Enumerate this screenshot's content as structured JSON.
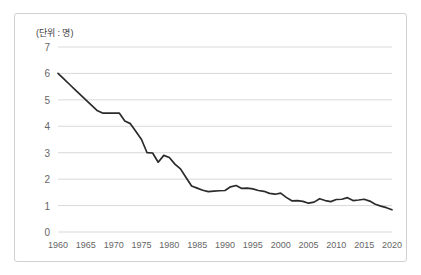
{
  "chart_data": {
    "type": "line",
    "title": "",
    "subtitle": "",
    "unit_label": "(단위 : 명)",
    "xlabel": "",
    "ylabel": "",
    "ylim": [
      0,
      7
    ],
    "xlim": [
      1960,
      2020
    ],
    "grid": true,
    "grid_axis": "y",
    "legend": false,
    "legend_position": "none",
    "line_color": "#2b2b2b",
    "grid_color": "#d9d9d9",
    "border_color": "#d0d0d0",
    "tick_color": "#666666",
    "y_ticks": [
      0,
      1,
      2,
      3,
      4,
      5,
      6,
      7
    ],
    "y_tick_labels": [
      "0",
      "1",
      "2",
      "3",
      "4",
      "5",
      "6",
      "7"
    ],
    "x_ticks": [
      1960,
      1965,
      1970,
      1975,
      1980,
      1985,
      1990,
      1995,
      2000,
      2005,
      2010,
      2015,
      2020
    ],
    "x_tick_labels": [
      "1960",
      "1965",
      "1970",
      "1975",
      "1980",
      "1985",
      "1990",
      "1995",
      "2000",
      "2005",
      "2010",
      "2015",
      "2020"
    ],
    "series": [
      {
        "name": "합계출산율",
        "x": [
          1960,
          1961,
          1962,
          1963,
          1964,
          1965,
          1966,
          1967,
          1968,
          1969,
          1970,
          1971,
          1972,
          1973,
          1974,
          1975,
          1976,
          1977,
          1978,
          1979,
          1980,
          1981,
          1982,
          1983,
          1984,
          1985,
          1986,
          1987,
          1988,
          1989,
          1990,
          1991,
          1992,
          1993,
          1994,
          1995,
          1996,
          1997,
          1998,
          1999,
          2000,
          2001,
          2002,
          2003,
          2004,
          2005,
          2006,
          2007,
          2008,
          2009,
          2010,
          2011,
          2012,
          2013,
          2014,
          2015,
          2016,
          2017,
          2018,
          2019,
          2020
        ],
        "values": [
          6.0,
          5.8,
          5.6,
          5.4,
          5.2,
          5.0,
          4.8,
          4.6,
          4.5,
          4.5,
          4.5,
          4.5,
          4.2,
          4.1,
          3.8,
          3.5,
          3.0,
          2.99,
          2.64,
          2.9,
          2.82,
          2.57,
          2.39,
          2.06,
          1.74,
          1.66,
          1.58,
          1.53,
          1.55,
          1.56,
          1.57,
          1.71,
          1.76,
          1.65,
          1.66,
          1.63,
          1.57,
          1.54,
          1.46,
          1.43,
          1.47,
          1.31,
          1.18,
          1.19,
          1.16,
          1.09,
          1.13,
          1.26,
          1.19,
          1.15,
          1.23,
          1.24,
          1.3,
          1.19,
          1.21,
          1.24,
          1.17,
          1.05,
          0.98,
          0.92,
          0.84
        ]
      }
    ]
  }
}
